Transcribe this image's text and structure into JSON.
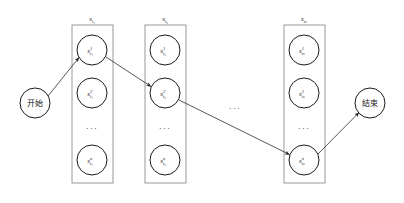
{
  "diagram": {
    "colors": {
      "stroke": "#3a3a3a",
      "node_stroke": "#1a1a1a",
      "box_stroke": "#777777",
      "text": "#1a1a1a",
      "background": "#ffffff"
    },
    "start_node": {
      "label": "开始",
      "cx": 35,
      "cy": 103,
      "r": 15
    },
    "end_node": {
      "label": "结束",
      "cx": 370,
      "cy": 103,
      "r": 15
    },
    "groups": [
      {
        "id": "group-1",
        "header": "s",
        "header_sub": "t₁",
        "box": {
          "x": 72,
          "y": 25,
          "w": 41,
          "h": 158
        },
        "header_x": 92,
        "header_y": 20,
        "nodes": [
          {
            "label": "s",
            "sup": "1",
            "sub": "t₁",
            "cx": 92,
            "cy": 50,
            "r": 15
          },
          {
            "label": "s",
            "sup": "2",
            "sub": "t₁",
            "cx": 92,
            "cy": 93,
            "r": 15
          },
          {
            "label": "s",
            "sup": "n",
            "sub": "t₁",
            "cx": 92,
            "cy": 160,
            "r": 15
          }
        ],
        "ellipsis": {
          "x": 92,
          "y": 128,
          "text": "···"
        }
      },
      {
        "id": "group-2",
        "header": "s",
        "header_sub": "t₂",
        "box": {
          "x": 145,
          "y": 25,
          "w": 41,
          "h": 158
        },
        "header_x": 165,
        "header_y": 20,
        "nodes": [
          {
            "label": "s",
            "sup": "1",
            "sub": "t₂",
            "cx": 165,
            "cy": 50,
            "r": 15
          },
          {
            "label": "s",
            "sup": "2",
            "sub": "t₂",
            "cx": 165,
            "cy": 93,
            "r": 15
          },
          {
            "label": "s",
            "sup": "n",
            "sub": "t₂",
            "cx": 165,
            "cy": 160,
            "r": 15
          }
        ],
        "ellipsis": {
          "x": 165,
          "y": 128,
          "text": "···"
        }
      },
      {
        "id": "group-k",
        "header": "s",
        "header_sub": "tₖ",
        "box": {
          "x": 284,
          "y": 25,
          "w": 41,
          "h": 158
        },
        "header_x": 304,
        "header_y": 20,
        "nodes": [
          {
            "label": "s",
            "sup": "1",
            "sub": "tₖ",
            "cx": 304,
            "cy": 50,
            "r": 15
          },
          {
            "label": "s",
            "sup": "2",
            "sub": "tₖ",
            "cx": 304,
            "cy": 93,
            "r": 15
          },
          {
            "label": "s",
            "sup": "n",
            "sub": "tₖ",
            "cx": 304,
            "cy": 160,
            "r": 15
          }
        ],
        "ellipsis": {
          "x": 304,
          "y": 128,
          "text": "···"
        }
      }
    ],
    "between_groups_ellipsis": {
      "x": 235,
      "y": 108,
      "text": "···"
    },
    "edges": [
      {
        "id": "edge-start-to-g1n1",
        "from": "start_node",
        "to": "group-1 node 1",
        "x1": 48,
        "y1": 96,
        "x2": 78,
        "y2": 58
      },
      {
        "id": "edge-g1n1-to-g2n2",
        "from": "group-1 node 1",
        "to": "group-2 node 2",
        "x1": 106,
        "y1": 57,
        "x2": 152,
        "y2": 87
      },
      {
        "id": "edge-g2n2-to-gkn3",
        "from": "group-2 node 2",
        "to": "group-k node n",
        "x1": 179,
        "y1": 100,
        "x2": 290,
        "y2": 155
      },
      {
        "id": "edge-gkn3-to-end",
        "from": "group-k node n",
        "to": "end_node",
        "x1": 318,
        "y1": 154,
        "x2": 359,
        "y2": 112
      }
    ]
  }
}
